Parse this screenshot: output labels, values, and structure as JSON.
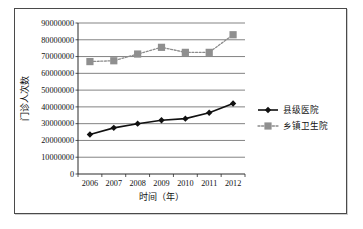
{
  "chart_data": {
    "type": "line",
    "title": "",
    "xlabel": "时间（年）",
    "ylabel": "门诊人次数",
    "categories": [
      "2006",
      "2007",
      "2008",
      "2009",
      "2010",
      "2011",
      "2012"
    ],
    "ylim": [
      0,
      90000000
    ],
    "ytick_step": 10000000,
    "yticks": [
      "0",
      "10000000",
      "20000000",
      "30000000",
      "40000000",
      "50000000",
      "60000000",
      "70000000",
      "80000000",
      "90000000"
    ],
    "grid": true,
    "legend_position": "right",
    "series": [
      {
        "name": "县级医院",
        "color": "#111111",
        "marker": "diamond",
        "linestyle": "solid",
        "values": [
          23500000,
          27500000,
          30000000,
          32000000,
          33000000,
          36500000,
          42000000
        ]
      },
      {
        "name": "乡镇卫生院",
        "color": "#8f8f8f",
        "marker": "square",
        "linestyle": "dotted",
        "values": [
          67000000,
          67500000,
          71500000,
          75500000,
          72500000,
          72500000,
          83000000
        ]
      }
    ]
  },
  "legend": {
    "items": [
      {
        "label": "县级医院"
      },
      {
        "label": "乡镇卫生院"
      }
    ]
  },
  "axes": {
    "y_title": "门诊人次数",
    "x_title": "时间（年）"
  }
}
